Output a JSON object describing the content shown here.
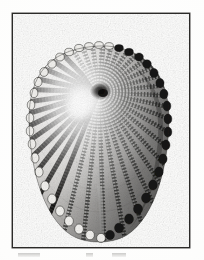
{
  "document": {
    "type": "engraved-plate",
    "medium": "halftone scan of an engraving",
    "page_background": "#ffffff",
    "ink_color": "#1b1a18",
    "paper_color": "#fdfdfc"
  },
  "frame": {
    "name": "plate-border",
    "border_color": "#2b2a28",
    "left": 12,
    "top": 13,
    "width": 178,
    "height": 235
  },
  "figure": {
    "title": "",
    "caption": "",
    "orientation": "apex upper-centre, ventral margin at bottom",
    "outline_shape": "ovate",
    "bounds": {
      "left": 27,
      "top": 46,
      "right": 165,
      "bottom": 238
    },
    "apex": {
      "x": 98,
      "y": 92
    },
    "rib_count": 34,
    "margin_style": "crenulated",
    "texture": "beaded cross-hatch on radiating ribs",
    "lighting": {
      "highlight_side": "left",
      "shadow_side": "right",
      "highlight_center": {
        "x": 80,
        "y": 100
      }
    },
    "features": [
      {
        "name": "umbo",
        "description": "dark apex knob"
      },
      {
        "name": "radial-ribs",
        "description": "radiating beaded ribs"
      },
      {
        "name": "ventral-cleft",
        "description": "pale vertical cleft at lower centre"
      },
      {
        "name": "scalloped-margin",
        "description": "bumpy rib terminations at edge"
      }
    ]
  },
  "caption_artifacts": [
    {
      "left": 18,
      "width": 22
    },
    {
      "left": 86,
      "width": 7
    },
    {
      "left": 112,
      "width": 14
    }
  ]
}
